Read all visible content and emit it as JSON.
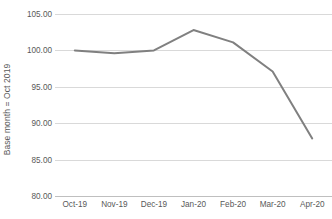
{
  "chart_data": {
    "type": "line",
    "title": "",
    "xlabel": "",
    "ylabel": "Base month = Oct 2019",
    "categories": [
      "Oct-19",
      "Nov-19",
      "Dec-19",
      "Jan-20",
      "Feb-20",
      "Mar-20",
      "Apr-20"
    ],
    "values": [
      100.0,
      99.6,
      100.0,
      102.8,
      101.1,
      97.1,
      87.9
    ],
    "series": [
      {
        "name": "Index",
        "values": [
          100.0,
          99.6,
          100.0,
          102.8,
          101.1,
          97.1,
          87.9
        ]
      }
    ],
    "ylim": [
      80.0,
      105.0
    ],
    "ytick_values": [
      105.0,
      100.0,
      95.0,
      90.0,
      85.0,
      80.0
    ],
    "ytick_labels": [
      "105.00",
      "100.00",
      "95.00",
      "90.00",
      "85.00",
      "80.00"
    ],
    "ytick_step": 5.0,
    "grid": true,
    "grid_axis": "y",
    "legend": false,
    "legend_position": "none",
    "line_color": "#808080",
    "line_width": 2,
    "markers": false,
    "gridline_color": "#d9d9d9",
    "axis_line_color": "#bfbfbf",
    "text_color": "#595959",
    "background_color": "#ffffff"
  },
  "axes": {
    "y_title": "Base month = Oct 2019"
  }
}
